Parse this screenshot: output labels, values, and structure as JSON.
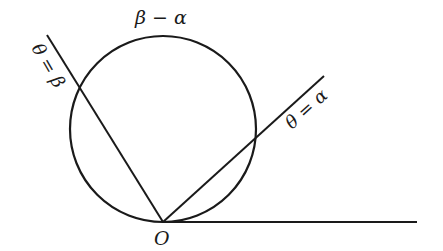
{
  "diagram": {
    "labels": {
      "arc": "β − α",
      "ray_beta": "θ = β",
      "ray_alpha": "θ = α",
      "origin": "O"
    },
    "colors": {
      "stroke": "#1a1a1a",
      "background": "#ffffff"
    }
  }
}
